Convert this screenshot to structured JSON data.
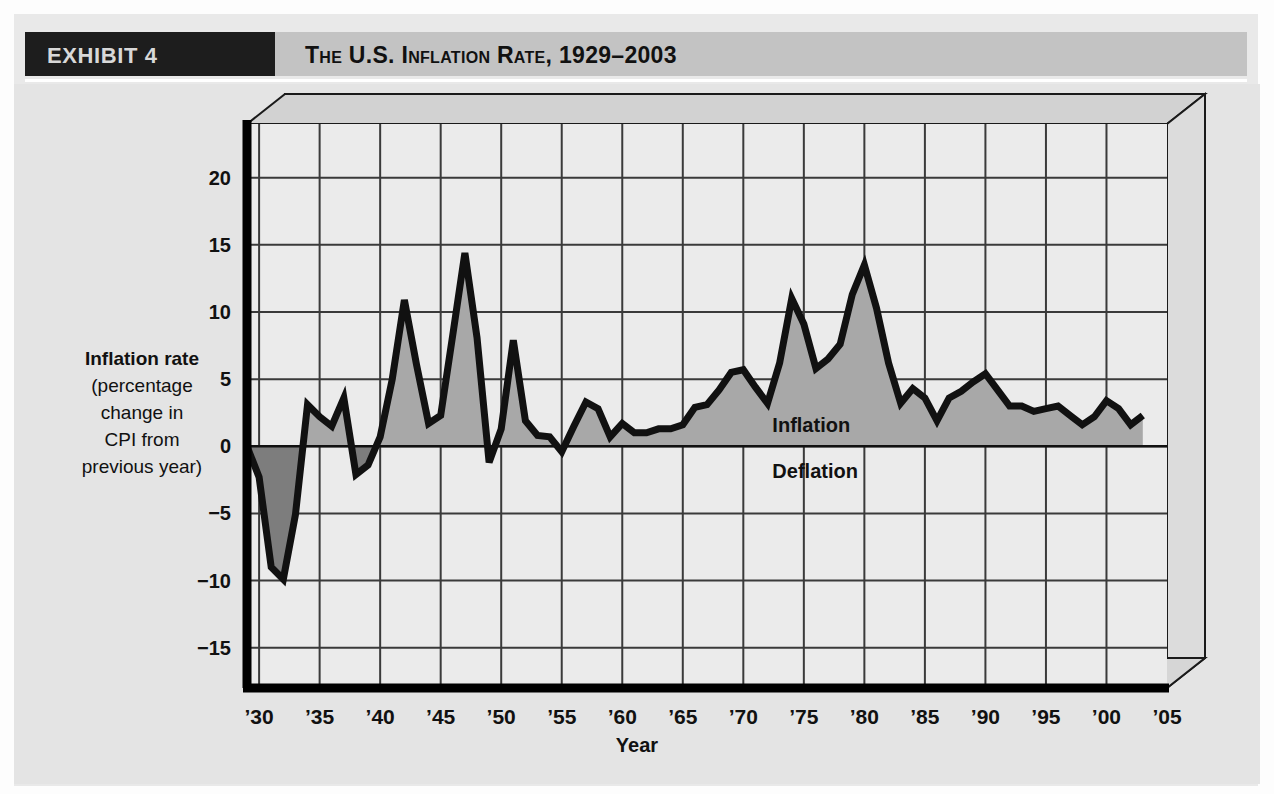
{
  "header": {
    "exhibit_label": "EXHIBIT 4",
    "title": "The U.S. Inflation Rate, 1929–2003",
    "box_color": "#1d1d1d",
    "band_color": "#c3c3c3"
  },
  "annotations": {
    "inflation": "Inflation",
    "deflation": "Deflation"
  },
  "axis_label_lines": {
    "line1": "Inflation rate",
    "line2": "(percentage",
    "line3": "change in",
    "line4": "CPI from",
    "line5": "previous year)"
  },
  "colors": {
    "positive_fill": "#a8a8a8",
    "negative_fill": "#7d7d7d",
    "plot_background": "#ebebeb",
    "line": "#111111",
    "grid": "#3a3a3a",
    "figure_background": "#e4e4e4"
  },
  "chart_data": {
    "type": "area",
    "title": "The U.S. Inflation Rate, 1929–2003",
    "xlabel": "Year",
    "ylabel": "Inflation rate (percentage change in CPI from previous year)",
    "xlim": [
      1929,
      2005
    ],
    "ylim": [
      -18,
      24
    ],
    "yticks": [
      20,
      15,
      10,
      5,
      0,
      -5,
      -10,
      -15
    ],
    "ytick_labels": [
      "20",
      "15",
      "10",
      "5",
      "0",
      "−5",
      "−10",
      "−15"
    ],
    "xticks": [
      1930,
      1935,
      1940,
      1945,
      1950,
      1955,
      1960,
      1965,
      1970,
      1975,
      1980,
      1985,
      1990,
      1995,
      2000,
      2005
    ],
    "xtick_labels": [
      "’30",
      "’35",
      "’40",
      "’45",
      "’50",
      "’55",
      "’60",
      "’65",
      "’70",
      "’75",
      "’80",
      "’85",
      "’90",
      "’95",
      "’00",
      "’05"
    ],
    "grid": true,
    "legend": false,
    "baseline": 0,
    "series": [
      {
        "name": "U.S. inflation rate (CPI, percent change from previous year)",
        "x": [
          1929,
          1930,
          1931,
          1932,
          1933,
          1934,
          1935,
          1936,
          1937,
          1938,
          1939,
          1940,
          1941,
          1942,
          1943,
          1944,
          1945,
          1946,
          1947,
          1948,
          1949,
          1950,
          1951,
          1952,
          1953,
          1954,
          1955,
          1956,
          1957,
          1958,
          1959,
          1960,
          1961,
          1962,
          1963,
          1964,
          1965,
          1966,
          1967,
          1968,
          1969,
          1970,
          1971,
          1972,
          1973,
          1974,
          1975,
          1976,
          1977,
          1978,
          1979,
          1980,
          1981,
          1982,
          1983,
          1984,
          1985,
          1986,
          1987,
          1988,
          1989,
          1990,
          1991,
          1992,
          1993,
          1994,
          1995,
          1996,
          1997,
          1998,
          1999,
          2000,
          2001,
          2002,
          2003
        ],
        "values": [
          0.0,
          -2.3,
          -9.0,
          -9.9,
          -5.1,
          3.1,
          2.2,
          1.5,
          3.6,
          -2.1,
          -1.4,
          0.7,
          5.0,
          10.9,
          6.1,
          1.7,
          2.3,
          8.3,
          14.4,
          8.1,
          -1.2,
          1.3,
          7.9,
          1.9,
          0.8,
          0.7,
          -0.4,
          1.5,
          3.3,
          2.8,
          0.7,
          1.7,
          1.0,
          1.0,
          1.3,
          1.3,
          1.6,
          2.9,
          3.1,
          4.2,
          5.5,
          5.7,
          4.4,
          3.2,
          6.2,
          11.0,
          9.1,
          5.8,
          6.5,
          7.6,
          11.3,
          13.5,
          10.3,
          6.2,
          3.2,
          4.3,
          3.6,
          1.9,
          3.6,
          4.1,
          4.8,
          5.4,
          4.2,
          3.0,
          3.0,
          2.6,
          2.8,
          3.0,
          2.3,
          1.6,
          2.2,
          3.4,
          2.8,
          1.6,
          2.3
        ]
      }
    ]
  }
}
